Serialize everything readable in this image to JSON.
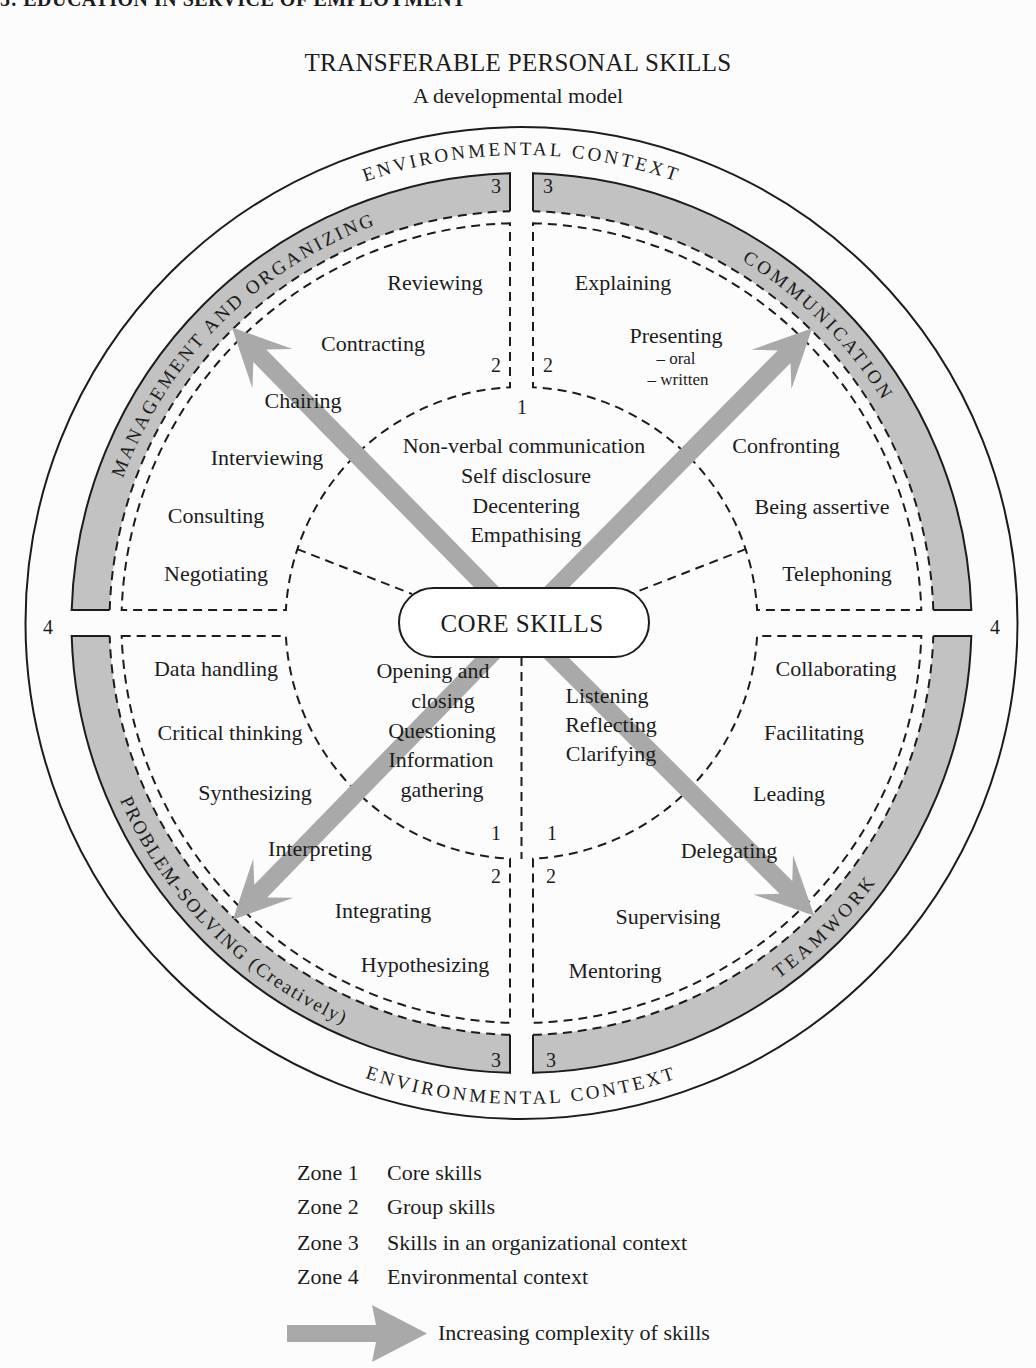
{
  "running_head": "5: EDUCATION IN SERVICE OF EMPLOYMENT",
  "title": "TRANSFERABLE PERSONAL SKILLS",
  "subtitle": "A developmental model",
  "diagram": {
    "environment": {
      "top": "ENVIRONMENTAL CONTEXT",
      "bottom": "ENVIRONMENTAL CONTEXT"
    },
    "core_label": "CORE SKILLS",
    "zone_markers": {
      "zone1": "1",
      "zone2": "2",
      "zone3": "3",
      "zone4": "4"
    },
    "quadrants": {
      "management": {
        "label": "MANAGEMENT AND ORGANIZING",
        "skills": [
          "Reviewing",
          "Contracting",
          "Chairing",
          "Interviewing",
          "Consulting",
          "Negotiating"
        ]
      },
      "communication": {
        "label": "COMMUNICATION",
        "skills": [
          "Explaining",
          "Presenting",
          "Confronting",
          "Being assertive",
          "Telephoning"
        ],
        "presenting_subitems": [
          "– oral",
          "– written"
        ]
      },
      "problem_solving": {
        "label": "PROBLEM-SOLVING (Creatively)",
        "skills": [
          "Data handling",
          "Critical thinking",
          "Synthesizing",
          "Interpreting",
          "Integrating",
          "Hypothesizing"
        ]
      },
      "teamwork": {
        "label": "TEAMWORK",
        "skills": [
          "Collaborating",
          "Facilitating",
          "Leading",
          "Delegating",
          "Supervising",
          "Mentoring"
        ]
      }
    },
    "core_skills": {
      "top": [
        "Non-verbal communication",
        "Self disclosure",
        "Decentering",
        "Empathising"
      ],
      "bottom_left": [
        "Opening and",
        "closing",
        "Questioning",
        "Information",
        "gathering"
      ],
      "bottom_right": [
        "Listening",
        "Reflecting",
        "Clarifying"
      ]
    }
  },
  "legend": {
    "zones": [
      {
        "zone": "Zone 1",
        "desc": "Core skills"
      },
      {
        "zone": "Zone 2",
        "desc": "Group skills"
      },
      {
        "zone": "Zone 3",
        "desc": "Skills in an organizational context"
      },
      {
        "zone": "Zone 4",
        "desc": "Environmental context"
      }
    ],
    "arrow_label": "Increasing complexity of skills"
  },
  "colors": {
    "band_gray": "#c2c2c2",
    "arrow_gray": "#a9a9a9",
    "ink": "#1c1c1c",
    "paper": "#fcfcfc"
  }
}
